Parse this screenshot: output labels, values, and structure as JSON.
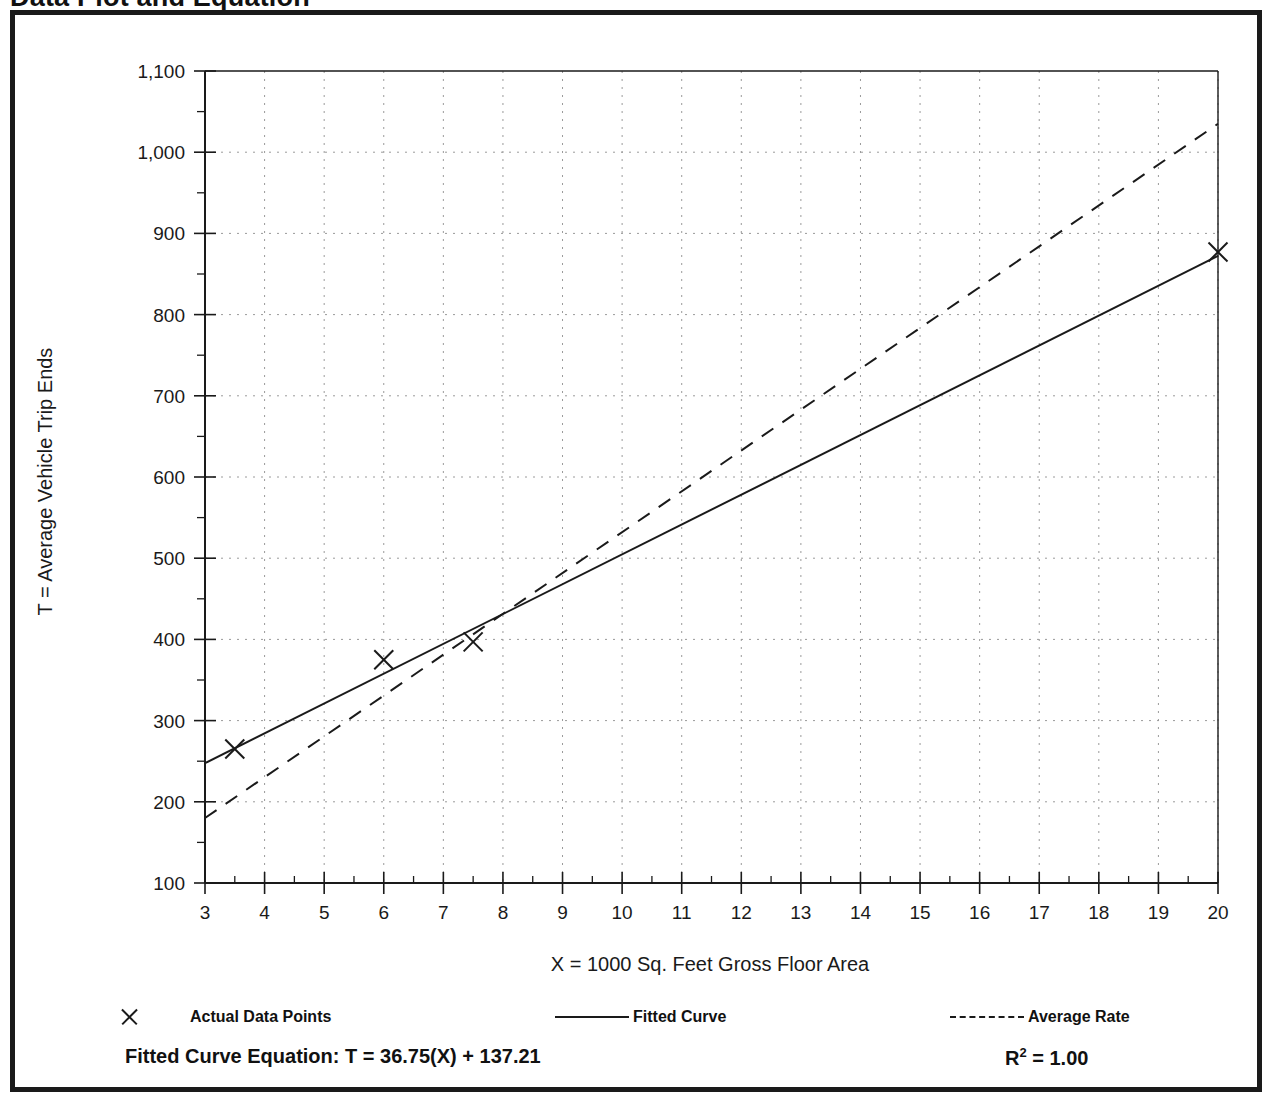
{
  "page": {
    "title": "Data Plot and Equation"
  },
  "chart_data": {
    "type": "scatter",
    "title": "Data Plot and Equation",
    "xlabel": "X = 1000 Sq. Feet Gross Floor Area",
    "ylabel": "T = Average Vehicle Trip Ends",
    "xlim": [
      3,
      20
    ],
    "ylim": [
      100,
      1100
    ],
    "xticks": [
      3,
      4,
      5,
      6,
      7,
      8,
      9,
      10,
      11,
      12,
      13,
      14,
      15,
      16,
      17,
      18,
      19,
      20
    ],
    "xtick_labels": [
      "3",
      "4",
      "5",
      "6",
      "7",
      "8",
      "9",
      "10",
      "11",
      "12",
      "13",
      "14",
      "15",
      "16",
      "17",
      "18",
      "19",
      "20"
    ],
    "yticks": [
      100,
      200,
      300,
      400,
      500,
      600,
      700,
      800,
      900,
      1000,
      1100
    ],
    "ytick_labels": [
      "100",
      "200",
      "300",
      "400",
      "500",
      "600",
      "700",
      "800",
      "900",
      "1,000",
      "1,100"
    ],
    "x_minor_tick_step": 0.5,
    "y_minor_tick_step": 50,
    "grid": true,
    "grid_style": "dotted",
    "legend_position": "below-axes",
    "series": [
      {
        "name": "Actual Data Points",
        "type": "scatter",
        "marker": "x",
        "points": [
          {
            "x": 3.5,
            "y": 265
          },
          {
            "x": 6.0,
            "y": 375
          },
          {
            "x": 7.5,
            "y": 397
          },
          {
            "x": 20.0,
            "y": 877
          }
        ]
      },
      {
        "name": "Fitted Curve",
        "type": "line",
        "style": "solid",
        "equation": "T = 36.75(X) + 137.21",
        "slope": 36.75,
        "intercept": 137.21,
        "endpoints": [
          {
            "x": 3.0,
            "y": 247.5
          },
          {
            "x": 20.0,
            "y": 872.2
          }
        ]
      },
      {
        "name": "Average Rate",
        "type": "line",
        "style": "dashed",
        "endpoints": [
          {
            "x": 3.0,
            "y": 180
          },
          {
            "x": 20.0,
            "y": 1035
          }
        ]
      }
    ]
  },
  "legend": {
    "items": [
      {
        "label": "Actual Data Points",
        "symbol": "x-marker"
      },
      {
        "label": "Fitted Curve",
        "symbol": "solid-line"
      },
      {
        "label": "Average Rate",
        "symbol": "dashed-line"
      }
    ]
  },
  "footer": {
    "equation_label": "Fitted Curve Equation:  T = 36.75(X) + 137.21",
    "r_squared_prefix": "R",
    "r_squared_exponent": "2",
    "r_squared_value": " = 1.00"
  },
  "colors": {
    "frame": "#1a1a1a",
    "axis": "#1a1a1a",
    "grid": "#9a9a9a",
    "series": "#1a1a1a",
    "background": "#ffffff"
  }
}
